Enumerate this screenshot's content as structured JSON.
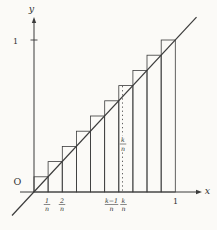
{
  "figure": {
    "colors": {
      "bg": "#fbfaf7",
      "stroke": "#3b3b3b",
      "text": "#333333"
    },
    "labels": {
      "y_axis": "y",
      "x_axis": "x",
      "origin": "O",
      "y_tick_1": "1",
      "x_tick_1": "1"
    },
    "fraction_ticks": [
      {
        "name": "tick-1-over-n",
        "num": "1",
        "den": "n",
        "x": 47,
        "y": 204.5
      },
      {
        "name": "tick-2-over-n",
        "num": "2",
        "den": "n",
        "x": 62,
        "y": 204.5
      },
      {
        "name": "tick-k-minus-1-over-n",
        "num": "k−1",
        "den": "n",
        "x": 111.5,
        "y": 204.5
      },
      {
        "name": "tick-k-over-n",
        "num": "k",
        "den": "n",
        "x": 123.5,
        "y": 204.5
      }
    ],
    "dashed_label": {
      "num": "k",
      "den": "n",
      "x": 123,
      "y": 144
    },
    "text_labels": [
      {
        "name": "y-axis-label",
        "bind": "y_axis",
        "x": 31.5,
        "y": 12,
        "size": 9.5,
        "italic": true
      },
      {
        "name": "x-axis-label",
        "bind": "x_axis",
        "x": 207.5,
        "y": 194,
        "size": 9.5,
        "italic": true
      },
      {
        "name": "origin-label",
        "bind": "origin",
        "x": 17.5,
        "y": 185,
        "size": 9.5,
        "italic": false
      },
      {
        "name": "y-tick-1-label",
        "bind": "y_tick_1",
        "x": 15.5,
        "y": 43.5,
        "size": 8,
        "italic": false
      },
      {
        "name": "x-tick-1-label",
        "bind": "x_tick_1",
        "x": 175.5,
        "y": 203.5,
        "size": 8,
        "italic": false
      }
    ],
    "geometry": {
      "width": 217,
      "height": 230,
      "origin": {
        "x": 34,
        "y": 192
      },
      "unit_x": 141.3,
      "unit_y": 152,
      "n": 10,
      "x_axis": {
        "x1": 20,
        "x2": 196,
        "arrow_tip": 202
      },
      "y_axis": {
        "y1": 22,
        "y2": 192,
        "arrow_tip": 17
      },
      "diagonal": {
        "x1": 12,
        "y1": 215.5,
        "x2": 196.5,
        "y2": 17.2
      },
      "dashed": {
        "x": 122.5,
        "y_top": 86,
        "gap_top": 135.5,
        "gap_bottom": 152.5
      },
      "y_tick_mark": {
        "y": 40,
        "x1": 30.5,
        "x2": 37.5
      }
    },
    "chart_data": {
      "type": "line",
      "description": "Upper Riemann sum staircase for y = x on [0,1], n subintervals; bar k spans [(k-1)/n, k/n] with height k/n",
      "line_points": [
        [
          0,
          0
        ],
        [
          1,
          1
        ]
      ],
      "n_bars": 10,
      "x_ticks": [
        "1/n",
        "2/n",
        "(k−1)/n",
        "k/n",
        "1"
      ],
      "y_ticks": [
        "1"
      ],
      "xlim": [
        0,
        1
      ],
      "ylim": [
        0,
        1
      ]
    }
  }
}
